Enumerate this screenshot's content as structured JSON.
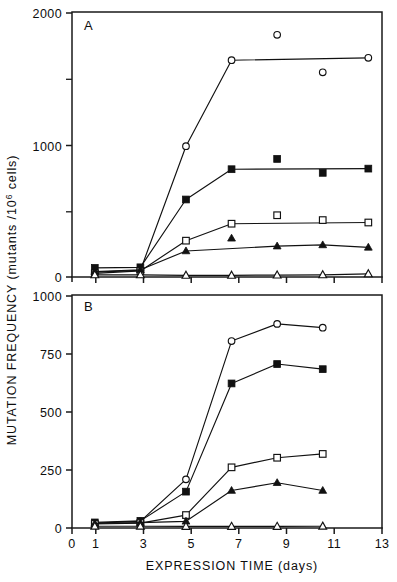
{
  "figure": {
    "width": 397,
    "height": 582,
    "background": "#ffffff",
    "ink_color": "#111111"
  },
  "axis_titles": {
    "y_main": "MUTATION FREQUENCY (mutants /",
    "y_exponent": "6",
    "y_tail": " cells)",
    "y_base": "10",
    "y_full": "MUTATION FREQUENCY (mutants /10^6 cells)",
    "x_full": "EXPRESSION TIME (days)"
  },
  "panels": [
    {
      "label": "A",
      "y_ticks_major": [
        0,
        1000,
        2000
      ],
      "y_ticks_minor": [
        500,
        1500
      ],
      "ylim": [
        0,
        2180
      ],
      "y_tick_labels": [
        "0",
        "1000",
        "2000"
      ]
    },
    {
      "label": "B",
      "y_ticks_major": [
        0,
        250,
        500,
        750,
        1000
      ],
      "y_ticks_minor": [],
      "ylim": [
        0,
        1040
      ],
      "y_tick_labels": [
        "0",
        "250",
        "500",
        "750",
        "1000"
      ]
    }
  ],
  "x_axis": {
    "ticks": [
      0,
      1,
      3,
      5,
      7,
      9,
      11,
      13
    ],
    "tick_labels": [
      "0",
      "1",
      "3",
      "5",
      "7",
      "9",
      "11",
      "13"
    ],
    "xlim": [
      0,
      13.6
    ],
    "label": "EXPRESSION TIME (days)"
  },
  "chart_data": {
    "type": "line",
    "title": "",
    "xlabel": "EXPRESSION TIME (days)",
    "ylabel": "MUTATION FREQUENCY (mutants /10^6 cells)",
    "grid": false,
    "legend": "none",
    "panels": [
      {
        "panel": "A",
        "ylim": [
          0,
          2180
        ],
        "xlim": [
          0,
          13.6
        ],
        "yticks": [
          0,
          500,
          1000,
          1500,
          2000
        ],
        "series": [
          {
            "name": "open-circle",
            "marker": "open-circle",
            "x": [
              1,
              3,
              5,
              7,
              9,
              11,
              13
            ],
            "y": [
              40,
              55,
              1080,
              1790,
              2000,
              1690,
              1810
            ],
            "connected_x": [
              1,
              3,
              5,
              7,
              13
            ],
            "connected_y": [
              40,
              55,
              1080,
              1790,
              1810
            ],
            "unconnected_x": [
              9,
              11
            ],
            "unconnected_y": [
              2000,
              1690
            ]
          },
          {
            "name": "filled-square",
            "marker": "filled-square",
            "x": [
              1,
              3,
              5,
              7,
              9,
              11,
              13
            ],
            "y": [
              75,
              80,
              640,
              890,
              975,
              860,
              895
            ],
            "connected_x": [
              1,
              3,
              5,
              7,
              13
            ],
            "connected_y": [
              75,
              80,
              640,
              890,
              895
            ],
            "unconnected_x": [
              9,
              11
            ],
            "unconnected_y": [
              975,
              860
            ]
          },
          {
            "name": "open-square",
            "marker": "open-square",
            "x": [
              1,
              3,
              5,
              7,
              9,
              11,
              13
            ],
            "y": [
              30,
              50,
              300,
              440,
              510,
              470,
              450
            ],
            "connected_x": [
              1,
              3,
              5,
              7,
              13
            ],
            "connected_y": [
              30,
              50,
              300,
              440,
              450
            ],
            "unconnected_x": [
              9,
              11
            ],
            "unconnected_y": [
              510,
              470
            ]
          },
          {
            "name": "filled-triangle",
            "marker": "filled-triangle",
            "x": [
              1,
              3,
              5,
              7,
              9,
              11,
              13
            ],
            "y": [
              45,
              60,
              215,
              320,
              255,
              265,
              245
            ],
            "connected_x": [
              1,
              3,
              5,
              9,
              11,
              13
            ],
            "connected_y": [
              45,
              60,
              215,
              255,
              265,
              245
            ],
            "unconnected_x": [
              7
            ],
            "unconnected_y": [
              320
            ]
          },
          {
            "name": "open-triangle",
            "marker": "open-triangle",
            "x": [
              1,
              3,
              5,
              7,
              9,
              11,
              13
            ],
            "y": [
              18,
              18,
              14,
              14,
              16,
              18,
              26
            ],
            "connected_x": [
              1,
              3,
              5,
              7,
              9,
              11,
              13
            ],
            "connected_y": [
              18,
              18,
              14,
              14,
              16,
              18,
              26
            ],
            "unconnected_x": [],
            "unconnected_y": []
          }
        ]
      },
      {
        "panel": "B",
        "ylim": [
          0,
          1040
        ],
        "xlim": [
          0,
          13.6
        ],
        "yticks": [
          0,
          250,
          500,
          750,
          1000
        ],
        "series": [
          {
            "name": "open-circle",
            "marker": "open-circle",
            "x": [
              1,
              3,
              5,
              7,
              9,
              11
            ],
            "y": [
              22,
              30,
              218,
              838,
              915,
              898
            ],
            "connected_x": [
              1,
              3,
              5,
              7,
              9,
              11
            ],
            "connected_y": [
              22,
              30,
              218,
              838,
              915,
              898
            ],
            "unconnected_x": [],
            "unconnected_y": []
          },
          {
            "name": "filled-square",
            "marker": "filled-square",
            "x": [
              1,
              3,
              5,
              7,
              9,
              11
            ],
            "y": [
              25,
              32,
              163,
              648,
              735,
              712
            ],
            "connected_x": [
              1,
              3,
              5,
              7,
              9,
              11
            ],
            "connected_y": [
              25,
              32,
              163,
              648,
              735,
              712
            ],
            "unconnected_x": [],
            "unconnected_y": []
          },
          {
            "name": "open-square",
            "marker": "open-square",
            "x": [
              1,
              3,
              5,
              7,
              9,
              11
            ],
            "y": [
              18,
              22,
              58,
              272,
              315,
              332
            ],
            "connected_x": [
              1,
              3,
              5,
              7,
              9,
              11
            ],
            "connected_y": [
              18,
              22,
              58,
              272,
              315,
              332
            ],
            "unconnected_x": [],
            "unconnected_y": []
          },
          {
            "name": "filled-triangle",
            "marker": "filled-triangle",
            "x": [
              1,
              3,
              5,
              7,
              9,
              11
            ],
            "y": [
              20,
              24,
              30,
              168,
              203,
              168
            ],
            "connected_x": [
              1,
              3,
              5,
              7,
              9,
              11
            ],
            "connected_y": [
              20,
              24,
              30,
              168,
              203,
              168
            ],
            "unconnected_x": [],
            "unconnected_y": []
          },
          {
            "name": "open-triangle",
            "marker": "open-triangle",
            "x": [
              1,
              3,
              5,
              7,
              9,
              11
            ],
            "y": [
              8,
              8,
              7,
              7,
              7,
              8
            ],
            "connected_x": [
              1,
              3,
              5,
              7,
              9,
              11
            ],
            "connected_y": [
              8,
              8,
              7,
              7,
              7,
              8
            ],
            "unconnected_x": [],
            "unconnected_y": []
          }
        ]
      }
    ]
  }
}
